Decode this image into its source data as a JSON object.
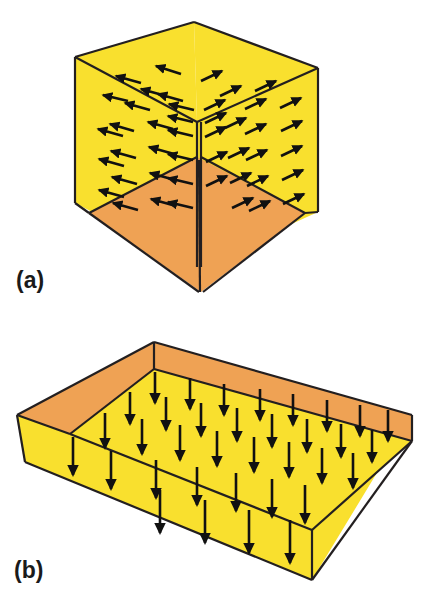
{
  "figure": {
    "background_color": "#ffffff",
    "stroke_color": "#231f20",
    "arrow_color": "#111111",
    "wall_color": "#f9e02e",
    "floor_color": "#efa254",
    "panels": [
      {
        "id": "panel-a",
        "label": "(a)",
        "label_x": 16,
        "label_y": 288,
        "caption_role": "field-lines-inward-box",
        "shape": "cube-interior",
        "description": "Cube viewed from inside showing two yellow back walls and an orange floor, with arrows on each wall pointing outward away from the central vertical corner",
        "faces": [
          {
            "name": "left-wall",
            "color": "#f9e02e",
            "points": "75,57 197,122 197,267 75,203"
          },
          {
            "name": "right-wall",
            "color": "#f9e02e",
            "points": "197,122 318,68 318,212 197,267"
          },
          {
            "name": "top-left-ceiling",
            "color": "#f9e02e",
            "points": "75,57 194,22 197,122"
          },
          {
            "name": "top-right-ceiling",
            "color": "#f9e02e",
            "points": "194,22 318,68 197,122"
          },
          {
            "name": "floor-left",
            "color": "#efa254",
            "points": "89,213 197,157 201,292"
          },
          {
            "name": "floor-right",
            "color": "#efa254",
            "points": "197,157 305,213 201,292"
          }
        ],
        "arrow_count": 44,
        "arrow_direction_left_wall": "left-and-up",
        "arrow_direction_right_wall": "right-and-up"
      },
      {
        "id": "panel-b",
        "label": "(b)",
        "label_x": 14,
        "label_y": 578,
        "caption_role": "uniform-downward-field-in-slab",
        "shape": "open-rectangular-tray",
        "description": "Shallow rectangular tray in perspective with orange inner back walls and a yellow floor, with a grid of straight downward arrows over the floor",
        "faces": [
          {
            "name": "back-left-inner-wall",
            "color": "#efa254",
            "points": "17,415 154,342 154,369 70,434"
          },
          {
            "name": "back-right-inner-wall",
            "color": "#efa254",
            "points": "154,342 412,415 412,441 154,369"
          },
          {
            "name": "floor",
            "color": "#f9e02e",
            "points": "70,434 154,369 412,441 312,530"
          },
          {
            "name": "front-left-outer-wall",
            "color": "#f9e02e",
            "points": "17,415 70,434 312,530 312,580 25,462"
          },
          {
            "name": "right-outer-wall",
            "color": "#f9e02e",
            "points": "412,415 412,441 312,530 312,580"
          }
        ],
        "arrow_count": 52,
        "arrow_direction": "straight-down"
      }
    ]
  }
}
